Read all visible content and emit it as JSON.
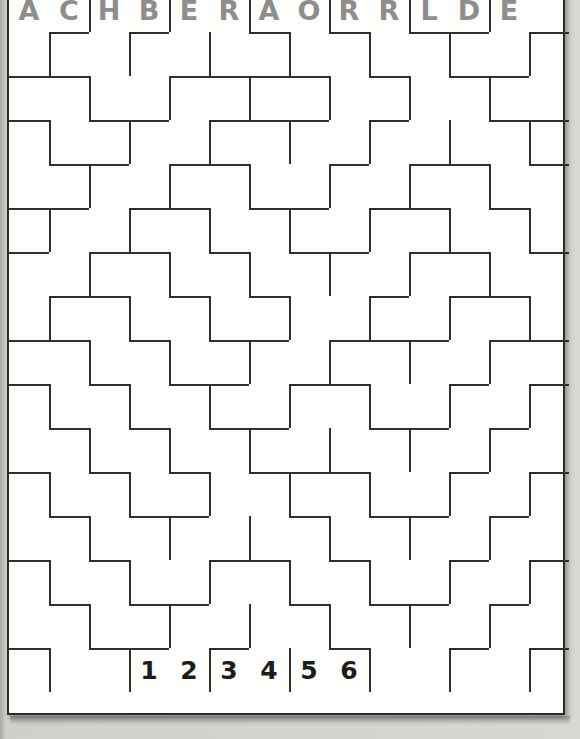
{
  "puzzle": {
    "kind": "letter-number-wall-grid",
    "columns": 14,
    "rows": 16,
    "cell_width": 40,
    "cell_height": 44,
    "colors": {
      "page_background": "#cfcfcb",
      "grid_background": "#fdfdfb",
      "wall": "#2f2f2f",
      "letter": "#8d8d8d",
      "number": "#1c1c1c",
      "frame_border": "#2b2b2b"
    },
    "header_letters": [
      {
        "col": 0,
        "text": "A"
      },
      {
        "col": 1,
        "text": "C"
      },
      {
        "col": 2,
        "text": "H"
      },
      {
        "col": 3,
        "text": "B"
      },
      {
        "col": 4,
        "text": "E"
      },
      {
        "col": 5,
        "text": "R"
      },
      {
        "col": 6,
        "text": "A"
      },
      {
        "col": 7,
        "text": "O"
      },
      {
        "col": 8,
        "text": "R"
      },
      {
        "col": 9,
        "text": "R"
      },
      {
        "col": 10,
        "text": "L"
      },
      {
        "col": 11,
        "text": "D"
      },
      {
        "col": 12,
        "text": "E"
      }
    ],
    "header_letters_string": "ACHBERAORRLDE",
    "footer_numbers": [
      {
        "col": 3,
        "text": "1"
      },
      {
        "col": 4,
        "text": "2"
      },
      {
        "col": 5,
        "text": "3"
      },
      {
        "col": 6,
        "text": "4"
      },
      {
        "col": 7,
        "text": "5"
      },
      {
        "col": 8,
        "text": "6"
      }
    ],
    "footer_numbers_string": "123456",
    "h_walls": [
      [
        1,
        1
      ],
      [
        1,
        3
      ],
      [
        1,
        6
      ],
      [
        1,
        8
      ],
      [
        1,
        10
      ],
      [
        1,
        11
      ],
      [
        1,
        13
      ],
      [
        2,
        0
      ],
      [
        2,
        1
      ],
      [
        2,
        4
      ],
      [
        2,
        5
      ],
      [
        2,
        6
      ],
      [
        2,
        7
      ],
      [
        2,
        9
      ],
      [
        2,
        11
      ],
      [
        2,
        12
      ],
      [
        3,
        0
      ],
      [
        3,
        2
      ],
      [
        3,
        3
      ],
      [
        3,
        5
      ],
      [
        3,
        6
      ],
      [
        3,
        7
      ],
      [
        3,
        9
      ],
      [
        3,
        12
      ],
      [
        3,
        13
      ],
      [
        4,
        1
      ],
      [
        4,
        2
      ],
      [
        4,
        4
      ],
      [
        4,
        5
      ],
      [
        4,
        8
      ],
      [
        4,
        10
      ],
      [
        4,
        11
      ],
      [
        4,
        13
      ],
      [
        5,
        0
      ],
      [
        5,
        1
      ],
      [
        5,
        3
      ],
      [
        5,
        4
      ],
      [
        5,
        6
      ],
      [
        5,
        7
      ],
      [
        5,
        9
      ],
      [
        5,
        10
      ],
      [
        5,
        12
      ],
      [
        6,
        0
      ],
      [
        6,
        2
      ],
      [
        6,
        3
      ],
      [
        6,
        5
      ],
      [
        6,
        7
      ],
      [
        6,
        8
      ],
      [
        6,
        10
      ],
      [
        6,
        11
      ],
      [
        6,
        13
      ],
      [
        7,
        1
      ],
      [
        7,
        2
      ],
      [
        7,
        4
      ],
      [
        7,
        6
      ],
      [
        7,
        9
      ],
      [
        7,
        11
      ],
      [
        7,
        12
      ],
      [
        8,
        0
      ],
      [
        8,
        1
      ],
      [
        8,
        3
      ],
      [
        8,
        5
      ],
      [
        8,
        6
      ],
      [
        8,
        8
      ],
      [
        8,
        9
      ],
      [
        8,
        10
      ],
      [
        8,
        12
      ],
      [
        8,
        13
      ],
      [
        9,
        0
      ],
      [
        9,
        2
      ],
      [
        9,
        4
      ],
      [
        9,
        5
      ],
      [
        9,
        7
      ],
      [
        9,
        8
      ],
      [
        9,
        11
      ],
      [
        9,
        13
      ],
      [
        10,
        1
      ],
      [
        10,
        3
      ],
      [
        10,
        5
      ],
      [
        10,
        6
      ],
      [
        10,
        9
      ],
      [
        10,
        10
      ],
      [
        10,
        12
      ],
      [
        11,
        0
      ],
      [
        11,
        2
      ],
      [
        11,
        4
      ],
      [
        11,
        6
      ],
      [
        11,
        7
      ],
      [
        11,
        8
      ],
      [
        11,
        11
      ],
      [
        11,
        13
      ],
      [
        12,
        1
      ],
      [
        12,
        3
      ],
      [
        12,
        4
      ],
      [
        12,
        7
      ],
      [
        12,
        9
      ],
      [
        12,
        10
      ],
      [
        12,
        12
      ],
      [
        13,
        0
      ],
      [
        13,
        2
      ],
      [
        13,
        5
      ],
      [
        13,
        6
      ],
      [
        13,
        8
      ],
      [
        13,
        11
      ],
      [
        13,
        13
      ],
      [
        14,
        1
      ],
      [
        14,
        3
      ],
      [
        14,
        4
      ],
      [
        14,
        7
      ],
      [
        14,
        9
      ],
      [
        14,
        10
      ],
      [
        14,
        12
      ],
      [
        15,
        0
      ],
      [
        15,
        2
      ],
      [
        15,
        3
      ],
      [
        15,
        5
      ],
      [
        15,
        8
      ],
      [
        15,
        11
      ],
      [
        15,
        13
      ]
    ],
    "v_walls": [
      [
        0,
        2
      ],
      [
        0,
        4
      ],
      [
        0,
        6
      ],
      [
        0,
        8
      ],
      [
        0,
        10
      ],
      [
        0,
        12
      ],
      [
        1,
        1
      ],
      [
        1,
        3
      ],
      [
        1,
        5
      ],
      [
        1,
        7
      ],
      [
        1,
        9
      ],
      [
        1,
        11
      ],
      [
        1,
        13
      ],
      [
        2,
        2
      ],
      [
        2,
        4
      ],
      [
        2,
        6
      ],
      [
        2,
        8
      ],
      [
        2,
        10
      ],
      [
        2,
        12
      ],
      [
        3,
        1
      ],
      [
        3,
        3
      ],
      [
        3,
        5
      ],
      [
        3,
        7
      ],
      [
        3,
        9
      ],
      [
        3,
        11
      ],
      [
        3,
        13
      ],
      [
        4,
        2
      ],
      [
        4,
        4
      ],
      [
        4,
        6
      ],
      [
        4,
        8
      ],
      [
        4,
        10
      ],
      [
        4,
        12
      ],
      [
        5,
        1
      ],
      [
        5,
        3
      ],
      [
        5,
        5
      ],
      [
        5,
        7
      ],
      [
        5,
        9
      ],
      [
        5,
        11
      ],
      [
        5,
        13
      ],
      [
        6,
        2
      ],
      [
        6,
        4
      ],
      [
        6,
        6
      ],
      [
        6,
        8
      ],
      [
        6,
        10
      ],
      [
        6,
        12
      ],
      [
        7,
        1
      ],
      [
        7,
        3
      ],
      [
        7,
        5
      ],
      [
        7,
        7
      ],
      [
        7,
        9
      ],
      [
        7,
        11
      ],
      [
        7,
        13
      ],
      [
        8,
        2
      ],
      [
        8,
        4
      ],
      [
        8,
        6
      ],
      [
        8,
        8
      ],
      [
        8,
        10
      ],
      [
        8,
        12
      ],
      [
        9,
        1
      ],
      [
        9,
        3
      ],
      [
        9,
        5
      ],
      [
        9,
        7
      ],
      [
        9,
        9
      ],
      [
        9,
        11
      ],
      [
        9,
        13
      ],
      [
        10,
        2
      ],
      [
        10,
        4
      ],
      [
        10,
        6
      ],
      [
        10,
        8
      ],
      [
        10,
        10
      ],
      [
        10,
        12
      ],
      [
        11,
        1
      ],
      [
        11,
        3
      ],
      [
        11,
        5
      ],
      [
        11,
        7
      ],
      [
        11,
        9
      ],
      [
        11,
        11
      ],
      [
        11,
        13
      ],
      [
        12,
        2
      ],
      [
        12,
        4
      ],
      [
        12,
        6
      ],
      [
        12,
        8
      ],
      [
        12,
        10
      ],
      [
        12,
        12
      ],
      [
        13,
        1
      ],
      [
        13,
        3
      ],
      [
        13,
        5
      ],
      [
        13,
        7
      ],
      [
        13,
        9
      ],
      [
        13,
        11
      ],
      [
        13,
        13
      ],
      [
        14,
        2
      ],
      [
        14,
        4
      ],
      [
        14,
        6
      ],
      [
        14,
        8
      ],
      [
        14,
        10
      ],
      [
        14,
        12
      ],
      [
        15,
        1
      ],
      [
        15,
        3
      ],
      [
        15,
        5
      ],
      [
        15,
        7
      ],
      [
        15,
        9
      ],
      [
        15,
        11
      ],
      [
        15,
        13
      ]
    ]
  }
}
